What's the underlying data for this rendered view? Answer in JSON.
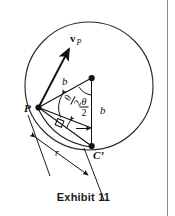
{
  "figure": {
    "caption": "Exhibit 11",
    "type": "geometry-diagram"
  },
  "labels": {
    "point_p": "P",
    "point_cprime": "C’",
    "radius_upper": "b",
    "radius_right": "b",
    "dimension_r": "r",
    "vector_symbol": "v",
    "vector_subscript": "P",
    "theta_symbol": "θ",
    "denominator": "2"
  },
  "colors": {
    "ink": "#111111",
    "circle_stroke": "#2a2a2a",
    "page_rule": "#8a8a8a",
    "background": "#ffffff"
  },
  "geometry": {
    "circle": {
      "cx": 89,
      "cy": 86,
      "r": 64
    },
    "point_p": {
      "x": 38,
      "y": 108
    },
    "center": {
      "x": 92,
      "y": 78
    },
    "point_cprime": {
      "x": 92,
      "y": 146
    },
    "vector_tip": {
      "x": 69,
      "y": 47
    }
  }
}
